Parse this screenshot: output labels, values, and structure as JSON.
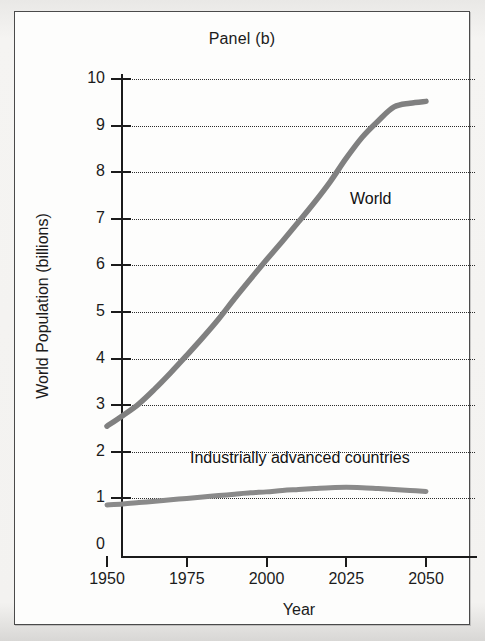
{
  "figure": {
    "title": "Panel (b)",
    "colors": {
      "curve": "#808080",
      "axis": "#1b1b1b",
      "grid": "#2b2b2b",
      "frame": "#4a4a4a",
      "background": "#fdfdfc"
    }
  },
  "chart_data": {
    "type": "line",
    "title": "Panel (b)",
    "xlabel": "Year",
    "ylabel": "World Population (billions)",
    "xlim": [
      1950,
      2050
    ],
    "ylim": [
      0,
      10
    ],
    "xticks": [
      "1950",
      "1975",
      "2000",
      "2025",
      "2050"
    ],
    "yticks": [
      "0",
      "1",
      "2",
      "3",
      "4",
      "5",
      "6",
      "7",
      "8",
      "9",
      "10"
    ],
    "grid": "horizontal-dotted",
    "legend": "inline-annotations",
    "x": [
      1950,
      1955,
      1960,
      1965,
      1970,
      1975,
      1980,
      1985,
      1990,
      1995,
      2000,
      2005,
      2010,
      2015,
      2020,
      2025,
      2030,
      2035,
      2040,
      2045,
      2050
    ],
    "series": [
      {
        "name": "World",
        "label_text": "World",
        "values": [
          2.55,
          2.78,
          3.03,
          3.35,
          3.7,
          4.07,
          4.45,
          4.85,
          5.29,
          5.71,
          6.12,
          6.52,
          6.93,
          7.35,
          7.8,
          8.3,
          8.75,
          9.1,
          9.4,
          9.48,
          9.52
        ]
      },
      {
        "name": "Industrially advanced countries",
        "label_text": "Industrially advanced countries",
        "values": [
          0.86,
          0.88,
          0.91,
          0.94,
          0.97,
          1.0,
          1.03,
          1.06,
          1.09,
          1.12,
          1.14,
          1.17,
          1.19,
          1.21,
          1.23,
          1.24,
          1.23,
          1.21,
          1.19,
          1.17,
          1.15
        ]
      }
    ]
  }
}
